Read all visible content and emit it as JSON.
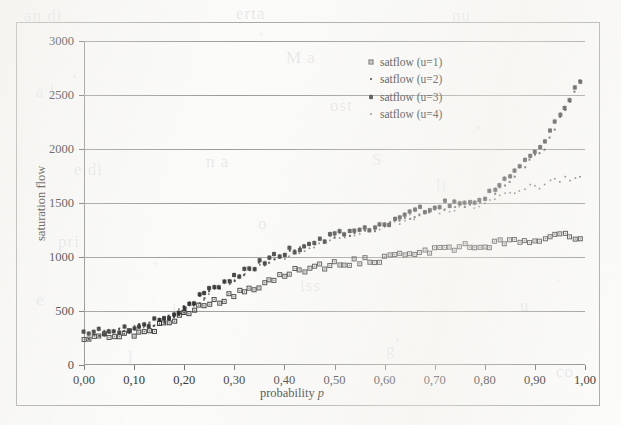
{
  "figure": {
    "background_color": "#fbfbfa",
    "ink_color": "#2b2b2b",
    "grid_color": "#9a9a97",
    "frame_color": "#a8a8a4"
  },
  "bleed_through_text": [
    {
      "text": "an di",
      "x": 24,
      "y": 6
    },
    {
      "text": "erta",
      "x": 236,
      "y": 4
    },
    {
      "text": "nu",
      "x": 452,
      "y": 6
    },
    {
      "text": "a l",
      "x": 36,
      "y": 82
    },
    {
      "text": "M a",
      "x": 286,
      "y": 48
    },
    {
      "text": "ost",
      "x": 330,
      "y": 96
    },
    {
      "text": "e di",
      "x": 74,
      "y": 160
    },
    {
      "text": "n a",
      "x": 206,
      "y": 152
    },
    {
      "text": "S",
      "x": 372,
      "y": 150
    },
    {
      "text": "li",
      "x": 436,
      "y": 176
    },
    {
      "text": "pri",
      "x": 58,
      "y": 232
    },
    {
      "text": "o",
      "x": 258,
      "y": 214
    },
    {
      "text": "a",
      "x": 470,
      "y": 236
    },
    {
      "text": "e",
      "x": 36,
      "y": 290
    },
    {
      "text": "i s",
      "x": 172,
      "y": 300
    },
    {
      "text": "iss",
      "x": 300,
      "y": 276
    },
    {
      "text": "u",
      "x": 520,
      "y": 296
    },
    {
      "text": "l",
      "x": 128,
      "y": 348
    },
    {
      "text": "g",
      "x": 386,
      "y": 340
    },
    {
      "text": "co",
      "x": 556,
      "y": 362
    }
  ],
  "legend": {
    "position": "top-right-inside",
    "entries": [
      {
        "label": "satflow (u=1)",
        "marker": "filled-square",
        "series_key": "u1"
      },
      {
        "label": "satflow (u=2)",
        "marker": "small-dot",
        "series_key": "u2"
      },
      {
        "label": "satflow (u=3)",
        "marker": "asterisk-square",
        "series_key": "u3"
      },
      {
        "label": "satflow (u=4)",
        "marker": "tiny-dot",
        "series_key": "u4"
      }
    ]
  },
  "chart_data": {
    "type": "scatter",
    "title": "",
    "xlabel": "probability p",
    "ylabel": "saturation flow",
    "xlim": [
      0.0,
      1.0
    ],
    "ylim": [
      0,
      3000
    ],
    "grid": true,
    "decimal_separator": ",",
    "xticks": [
      0.0,
      0.1,
      0.2,
      0.3,
      0.4,
      0.5,
      0.6,
      0.7,
      0.8,
      0.9,
      1.0
    ],
    "xtick_labels": [
      "0,00",
      "0,10",
      "0,20",
      "0,30",
      "0,40",
      "0,50",
      "0,60",
      "0,70",
      "0,80",
      "0,90",
      "1,00"
    ],
    "yticks": [
      0,
      500,
      1000,
      1500,
      2000,
      2500,
      3000
    ],
    "ytick_labels": [
      "0",
      "500",
      "1000",
      "1500",
      "2000",
      "2500",
      "3000"
    ],
    "x": [
      0.0,
      0.01,
      0.02,
      0.03,
      0.04,
      0.05,
      0.06,
      0.07,
      0.08,
      0.09,
      0.1,
      0.11,
      0.12,
      0.13,
      0.14,
      0.15,
      0.16,
      0.17,
      0.18,
      0.19,
      0.2,
      0.21,
      0.22,
      0.23,
      0.24,
      0.25,
      0.26,
      0.27,
      0.28,
      0.29,
      0.3,
      0.31,
      0.32,
      0.33,
      0.34,
      0.35,
      0.36,
      0.37,
      0.38,
      0.39,
      0.4,
      0.41,
      0.42,
      0.43,
      0.44,
      0.45,
      0.46,
      0.47,
      0.48,
      0.49,
      0.5,
      0.51,
      0.52,
      0.53,
      0.54,
      0.55,
      0.56,
      0.57,
      0.58,
      0.59,
      0.6,
      0.61,
      0.62,
      0.63,
      0.64,
      0.65,
      0.66,
      0.67,
      0.68,
      0.69,
      0.7,
      0.71,
      0.72,
      0.73,
      0.74,
      0.75,
      0.76,
      0.77,
      0.78,
      0.79,
      0.8,
      0.81,
      0.82,
      0.83,
      0.84,
      0.85,
      0.86,
      0.87,
      0.88,
      0.89,
      0.9,
      0.91,
      0.92,
      0.93,
      0.94,
      0.95,
      0.96,
      0.97,
      0.98,
      0.99
    ],
    "series": [
      {
        "name": "satflow (u=1)",
        "key": "u1",
        "marker": "filled-square",
        "values": [
          240,
          225,
          248,
          262,
          268,
          272,
          278,
          276,
          282,
          288,
          296,
          304,
          318,
          330,
          342,
          356,
          372,
          392,
          412,
          438,
          468,
          492,
          512,
          528,
          546,
          560,
          578,
          596,
          610,
          628,
          648,
          664,
          682,
          700,
          718,
          736,
          752,
          772,
          790,
          812,
          836,
          852,
          866,
          878,
          888,
          896,
          902,
          910,
          918,
          924,
          930,
          936,
          942,
          948,
          952,
          956,
          962,
          968,
          974,
          980,
          988,
          996,
          1004,
          1014,
          1022,
          1032,
          1042,
          1050,
          1056,
          1062,
          1068,
          1074,
          1078,
          1084,
          1088,
          1092,
          1096,
          1100,
          1104,
          1108,
          1112,
          1118,
          1124,
          1130,
          1136,
          1142,
          1148,
          1154,
          1158,
          1164,
          1170,
          1176,
          1180,
          1184,
          1188,
          1190,
          1192,
          1194,
          1190,
          1186
        ]
      },
      {
        "name": "satflow (u=2)",
        "key": "u2",
        "marker": "small-dot",
        "values": [
          300,
          268,
          290,
          300,
          308,
          312,
          318,
          316,
          322,
          330,
          340,
          352,
          364,
          378,
          392,
          406,
          424,
          444,
          466,
          492,
          520,
          552,
          582,
          610,
          640,
          668,
          698,
          722,
          752,
          780,
          806,
          830,
          856,
          880,
          900,
          920,
          944,
          968,
          992,
          1010,
          1024,
          1040,
          1054,
          1070,
          1086,
          1102,
          1118,
          1136,
          1154,
          1172,
          1186,
          1198,
          1206,
          1216,
          1222,
          1232,
          1242,
          1254,
          1266,
          1278,
          1290,
          1306,
          1322,
          1342,
          1362,
          1384,
          1400,
          1416,
          1426,
          1438,
          1450,
          1462,
          1472,
          1482,
          1492,
          1500,
          1496,
          1502,
          1512,
          1526,
          1548,
          1576,
          1610,
          1650,
          1690,
          1726,
          1764,
          1806,
          1848,
          1894,
          1944,
          1988,
          2020,
          2110,
          2210,
          2290,
          2380,
          2460,
          2520,
          2610
        ]
      },
      {
        "name": "satflow (u=3)",
        "key": "u3",
        "marker": "asterisk-square",
        "values": [
          318,
          282,
          296,
          308,
          314,
          320,
          326,
          324,
          330,
          338,
          348,
          360,
          372,
          386,
          400,
          416,
          434,
          456,
          478,
          504,
          534,
          566,
          596,
          626,
          656,
          686,
          714,
          740,
          770,
          798,
          824,
          848,
          874,
          898,
          918,
          940,
          962,
          986,
          1010,
          1028,
          1042,
          1058,
          1072,
          1088,
          1104,
          1120,
          1136,
          1154,
          1172,
          1188,
          1202,
          1212,
          1222,
          1232,
          1240,
          1250,
          1260,
          1272,
          1284,
          1296,
          1310,
          1326,
          1344,
          1364,
          1386,
          1404,
          1420,
          1434,
          1444,
          1456,
          1468,
          1480,
          1490,
          1500,
          1510,
          1518,
          1514,
          1520,
          1530,
          1546,
          1570,
          1600,
          1636,
          1676,
          1716,
          1752,
          1792,
          1834,
          1878,
          1924,
          1972,
          2016,
          2050,
          2140,
          2240,
          2320,
          2410,
          2480,
          2540,
          2630
        ]
      },
      {
        "name": "satflow (u=4)",
        "key": "u4",
        "marker": "tiny-dot",
        "values": [
          286,
          256,
          280,
          292,
          300,
          306,
          312,
          310,
          316,
          324,
          334,
          346,
          358,
          372,
          386,
          400,
          418,
          438,
          460,
          486,
          514,
          544,
          574,
          602,
          632,
          660,
          690,
          714,
          742,
          770,
          796,
          820,
          846,
          868,
          890,
          910,
          932,
          956,
          980,
          998,
          1014,
          1030,
          1044,
          1058,
          1074,
          1090,
          1106,
          1122,
          1140,
          1158,
          1172,
          1184,
          1192,
          1202,
          1208,
          1218,
          1228,
          1238,
          1250,
          1262,
          1274,
          1290,
          1306,
          1324,
          1344,
          1362,
          1378,
          1392,
          1402,
          1412,
          1422,
          1432,
          1440,
          1448,
          1456,
          1462,
          1458,
          1462,
          1468,
          1476,
          1490,
          1506,
          1524,
          1544,
          1562,
          1580,
          1596,
          1612,
          1626,
          1640,
          1652,
          1664,
          1676,
          1688,
          1698,
          1708,
          1718,
          1728,
          1740,
          1752
        ]
      }
    ]
  }
}
